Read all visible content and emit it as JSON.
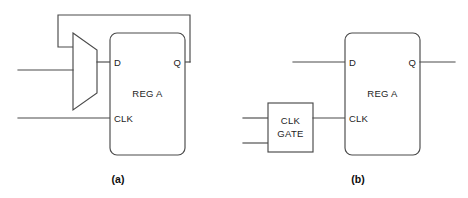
{
  "figure": {
    "type": "logic-block-diagram",
    "background_color": "#ffffff",
    "line_color": "#4a4a4a",
    "text_color": "#1d1d1d"
  },
  "panel_a": {
    "caption": "(a)",
    "register": {
      "name": "REG A",
      "pins": {
        "d": "D",
        "q": "Q",
        "clk": "CLK"
      }
    },
    "mux": {
      "name": "multiplexer",
      "label": ""
    }
  },
  "panel_b": {
    "caption": "(b)",
    "register": {
      "name": "REG A",
      "pins": {
        "d": "D",
        "q": "Q",
        "clk": "CLK"
      }
    },
    "clock_gate": {
      "line1": "CLK",
      "line2": "GATE"
    }
  }
}
